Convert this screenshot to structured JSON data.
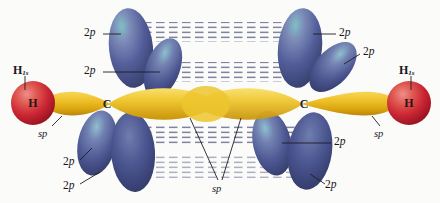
{
  "figure": {
    "background_color": "#fbfbfa"
  },
  "colors": {
    "sp_orbital": "#e8b51c",
    "sp_orbital_light": "#f6d44a",
    "sp_orbital_dark": "#c08c0a",
    "p_orbital": "#4a5591",
    "p_orbital_light": "#8d9ac4",
    "p_orbital_highlight": "#5fb0b8",
    "p_orbital_dark": "#343c६b",
    "hydrogen": "#cf2233",
    "hydrogen_light": "#e8737d",
    "hydrogen_dark": "#9c1622",
    "overlap_dash": "#5b6281",
    "leader_line": "#1d1d24",
    "label_text": "#17171c"
  },
  "atoms": [
    {
      "id": "h-left",
      "symbol": "H",
      "x": 33,
      "y": 103
    },
    {
      "id": "c-left",
      "symbol": "C",
      "x": 107,
      "y": 104
    },
    {
      "id": "c-right",
      "symbol": "C",
      "x": 304,
      "y": 104
    },
    {
      "id": "h-right",
      "symbol": "H",
      "x": 409,
      "y": 103
    }
  ],
  "labels": {
    "hydrogen_left": {
      "text": "H",
      "subscript": "1s",
      "x": 13,
      "y": 64
    },
    "hydrogen_right": {
      "text": "H",
      "subscript": "1s",
      "x": 399,
      "y": 64
    },
    "sp_left": {
      "text": "sp",
      "x": 38,
      "y": 129
    },
    "sp_right": {
      "text": "sp",
      "x": 374,
      "y": 129
    },
    "sp_center": {
      "text": "sp",
      "x": 212,
      "y": 184
    },
    "p_orbitals": [
      {
        "text": "2p",
        "x": 84,
        "y": 30,
        "position": "upper-left-outer"
      },
      {
        "text": "2p",
        "x": 84,
        "y": 68,
        "position": "upper-left-inner"
      },
      {
        "text": "2p",
        "x": 63,
        "y": 161,
        "position": "lower-left-inner"
      },
      {
        "text": "2p",
        "x": 63,
        "y": 186,
        "position": "lower-left-outer"
      },
      {
        "text": "2p",
        "x": 339,
        "y": 30,
        "position": "upper-right-outer"
      },
      {
        "text": "2p",
        "x": 363,
        "y": 49,
        "position": "upper-right-inner"
      },
      {
        "text": "2p",
        "x": 334,
        "y": 139,
        "position": "lower-right-inner"
      },
      {
        "text": "2p",
        "x": 325,
        "y": 183,
        "position": "lower-right-outer"
      }
    ]
  },
  "chart_data": {
    "type": "diagram",
    "molecule": "C2H2",
    "orbital_types": [
      "1s",
      "sp",
      "2p"
    ],
    "counts": {
      "hydrogen_1s_orbitals": 2,
      "sp_hybrid_orbitals": 4,
      "unhybridized_2p_orbitals": 4,
      "sigma_bonds": 3,
      "pi_bonds": 2
    },
    "label_counts": {
      "2p": 8,
      "sp": 3,
      "H_1s": 2,
      "H": 2,
      "C": 2
    },
    "pi_overlap_regions": [
      {
        "name": "upper-outer-pi",
        "y": 36,
        "style": "horizontal dashed rows"
      },
      {
        "name": "upper-inner-pi",
        "y": 72,
        "style": "horizontal dashed rows"
      },
      {
        "name": "lower-inner-pi",
        "y": 135,
        "style": "horizontal dashed rows"
      },
      {
        "name": "lower-outer-pi",
        "y": 166,
        "style": "horizontal dashed rows"
      }
    ]
  }
}
